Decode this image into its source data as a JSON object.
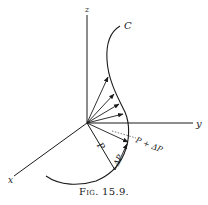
{
  "figure": {
    "caption_prefix": "Fig.",
    "caption_number": "15.9.",
    "labels": {
      "z_axis": "z",
      "y_axis": "y",
      "x_axis": "x",
      "curve": "C",
      "vector_p": "P",
      "vector_p_plus": "P + ΔP",
      "delta_p": "ΔP"
    },
    "colors": {
      "ink": "#1a1a1a",
      "background": "#ffffff"
    }
  }
}
